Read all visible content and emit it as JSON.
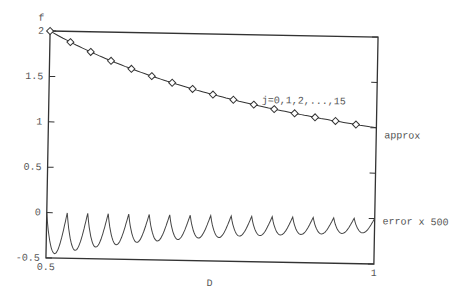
{
  "chart_data": {
    "type": "line",
    "title": "",
    "xlabel": "D",
    "ylabel": "f",
    "xlim": [
      0.5,
      1
    ],
    "ylim": [
      -0.5,
      2
    ],
    "x_ticks": [
      "0.5",
      "1"
    ],
    "y_ticks": [
      "-0.5",
      "0",
      "0.5",
      "1",
      "1.5",
      "2"
    ],
    "grid": false,
    "annotation": "j=0,1,2,...,15",
    "series": [
      {
        "name": "approx",
        "function": "1/D",
        "marker": "diamond",
        "x": [
          0.5,
          0.53125,
          0.5625,
          0.59375,
          0.625,
          0.65625,
          0.6875,
          0.71875,
          0.75,
          0.78125,
          0.8125,
          0.84375,
          0.875,
          0.90625,
          0.9375,
          0.96875
        ],
        "values": [
          2.0,
          1.882,
          1.778,
          1.684,
          1.6,
          1.524,
          1.455,
          1.391,
          1.333,
          1.28,
          1.231,
          1.185,
          1.143,
          1.103,
          1.067,
          1.032
        ]
      },
      {
        "name": "error x 500",
        "marker": "none",
        "description": "16 arches, zero at each node, troughs from about -0.45 near D=0.5 shrinking to about -0.2 near D=1",
        "trough_values": [
          -0.45,
          -0.41,
          -0.37,
          -0.34,
          -0.31,
          -0.29,
          -0.27,
          -0.25,
          -0.24,
          -0.22,
          -0.21,
          -0.2,
          -0.19,
          -0.18,
          -0.17,
          -0.16
        ]
      }
    ]
  },
  "labels": {
    "ylabel": "f",
    "xlabel": "D",
    "y_ticks": [
      "2",
      "1.5",
      "1",
      "0.5",
      "0",
      "-0.5"
    ],
    "x_ticks": [
      "0.5",
      "1"
    ],
    "annotation": "j=0,1,2,...,15",
    "series_approx": "approx",
    "series_error": "error x 500"
  }
}
